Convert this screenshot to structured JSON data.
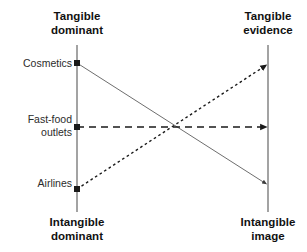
{
  "diagram": {
    "title_top_left": "Tangible\ndominant",
    "title_top_right": "Tangible\nevidence",
    "title_bottom_left": "Intangible\ndominant",
    "title_bottom_right": "Intangible\nimage",
    "row_labels": [
      "Cosmetics",
      "Fast-food\noutlets",
      "Airlines"
    ],
    "colors": {
      "axis": "#8c8c8c",
      "line_solid": "#6e6e6e",
      "line_dashed": "#1a1a1a",
      "line_dotted": "#1a1a1a",
      "text": "#1a1a1a",
      "background": "#ffffff"
    }
  },
  "chart_data": {
    "type": "line",
    "title": "",
    "xlabel": "",
    "ylabel": "",
    "left_axis_label_top": "Tangible dominant",
    "left_axis_label_bottom": "Intangible dominant",
    "right_axis_label_top": "Tangible evidence",
    "right_axis_label_bottom": "Intangible image",
    "categories": [
      "Tangible dominant",
      "Tangible evidence"
    ],
    "series": [
      {
        "name": "Cosmetics",
        "style": "solid",
        "start_marker": "square",
        "end_marker": "arrow",
        "values": [
          1.0,
          0.12
        ],
        "points": [
          [
            77,
            63
          ],
          [
            268,
            185
          ]
        ]
      },
      {
        "name": "Fast-food outlets",
        "style": "dashed",
        "start_marker": "square",
        "end_marker": "arrow",
        "values": [
          0.55,
          0.55
        ],
        "points": [
          [
            77,
            127
          ],
          [
            268,
            127
          ]
        ]
      },
      {
        "name": "Airlines",
        "style": "dotted",
        "start_marker": "square",
        "end_marker": "arrow",
        "values": [
          0.1,
          1.0
        ],
        "points": [
          [
            77,
            189
          ],
          [
            268,
            64
          ]
        ]
      }
    ],
    "axes": {
      "left_x": 77,
      "right_x": 268,
      "top_y": 45,
      "bottom_y": 212,
      "grid": false
    },
    "legend": "none"
  }
}
